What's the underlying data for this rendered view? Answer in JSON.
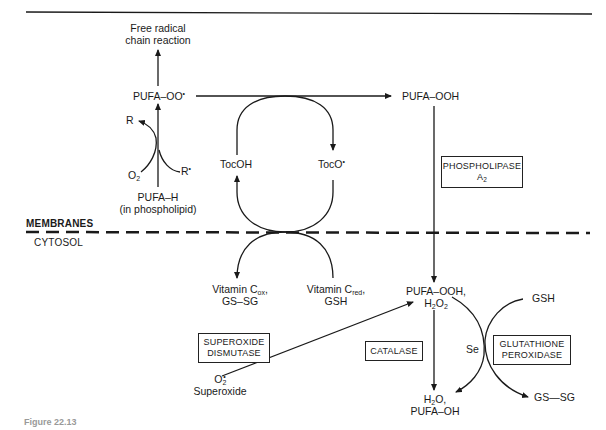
{
  "figure": {
    "caption_visible": "Figure 22.13",
    "regions": {
      "upper": "MEMBRANES",
      "lower": "CYTOSOL"
    },
    "nodes": {
      "free_radical": {
        "line1": "Free radical",
        "line2": "chain reaction"
      },
      "pufa_oo": {
        "base": "PUFA–OO",
        "sup": "•"
      },
      "pufa_ooh_top": "PUFA–OOH",
      "r_product": "R",
      "r_radical": {
        "base": "R",
        "sup": "•"
      },
      "o2_in": {
        "base": "O",
        "sub": "2"
      },
      "pufa_h": {
        "line1": "PUFA–H",
        "line2": "(in phospholipid)"
      },
      "tocoh": "TocOH",
      "toco": {
        "base": "TocO",
        "sup": "•"
      },
      "vitc_ox": {
        "base": "Vitamin C",
        "sub": "ox",
        "tail": ",",
        "line2": "GS–SG"
      },
      "vitc_red": {
        "base": "Vitamin C",
        "sub": "red",
        "tail": ",",
        "line2": "GSH"
      },
      "pufa_ooh_h2o2": {
        "line1": "PUFA–OOH,",
        "line2_base": "H",
        "line2_sub1": "2",
        "line2_mid": "O",
        "line2_sub2": "2"
      },
      "h2o_pufa_oh": {
        "line1_base": "H",
        "line1_sub": "2",
        "line1_tail": "O,",
        "line2": "PUFA–OH"
      },
      "superoxide": {
        "base": "O",
        "sup": "•",
        "sub": "2",
        "label": "Superoxide"
      },
      "gsh_right": "GSH",
      "gssg_right": "GS—SG",
      "se": "Se"
    },
    "enzymes": {
      "phospholipase": {
        "line1": "PHOSPHOLIPASE",
        "line2_base": "A",
        "line2_sub": "2"
      },
      "superoxide_dismutase": {
        "line1": "SUPEROXIDE",
        "line2": "DISMUTASE"
      },
      "catalase": "CATALASE",
      "glutathione_peroxidase": {
        "line1": "GLUTATHIONE",
        "line2": "PEROXIDASE"
      }
    },
    "colors": {
      "ink": "#1a1a1a",
      "background": "#ffffff"
    }
  }
}
